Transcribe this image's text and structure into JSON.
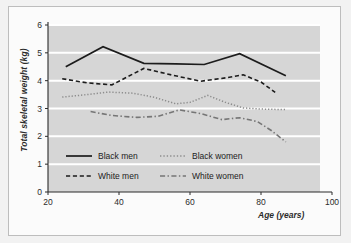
{
  "figure": {
    "background_color": "#f2f2f2",
    "panel_color": "#fbfbfb",
    "plot_band_color": "#d6d6d6",
    "gridline_color": "#ffffff",
    "axis_color": "#2b2b2b"
  },
  "chart_data": {
    "type": "line",
    "title": "",
    "xlabel": "Age (years)",
    "ylabel": "Total skeletal weight (kg)",
    "xlim": [
      20,
      100
    ],
    "ylim": [
      0,
      6
    ],
    "xticks": [
      20,
      40,
      60,
      80,
      100
    ],
    "yticks": [
      0,
      1,
      2,
      3,
      4,
      5,
      6
    ],
    "grid": "horizontal",
    "legend_position": "inside-lower-left",
    "series": [
      {
        "name": "Black men",
        "style": "solid",
        "color": "#1c1c1c",
        "x": [
          25,
          35.5,
          47,
          56,
          64,
          74,
          87
        ],
        "y": [
          4.5,
          5.22,
          4.62,
          4.6,
          4.58,
          4.97,
          4.18
        ]
      },
      {
        "name": "Black women",
        "style": "dotted",
        "color": "#8d8d8d",
        "x": [
          24,
          31,
          37,
          44,
          50,
          56,
          60,
          65,
          70,
          75,
          80,
          87
        ],
        "y": [
          3.41,
          3.5,
          3.59,
          3.55,
          3.4,
          3.17,
          3.22,
          3.47,
          3.22,
          3.02,
          2.98,
          2.96
        ]
      },
      {
        "name": "White men",
        "style": "dashed",
        "color": "#1c1c1c",
        "x": [
          24,
          31,
          38,
          47,
          55,
          63,
          70,
          75,
          80,
          84
        ],
        "y": [
          4.07,
          3.92,
          3.85,
          4.44,
          4.2,
          3.98,
          4.1,
          4.21,
          3.95,
          3.58
        ]
      },
      {
        "name": "White women",
        "style": "dashdot",
        "color": "#767676",
        "x": [
          32,
          38,
          45,
          51,
          57,
          63,
          69,
          74,
          79,
          83,
          87
        ],
        "y": [
          2.89,
          2.75,
          2.68,
          2.72,
          2.95,
          2.82,
          2.6,
          2.67,
          2.53,
          2.2,
          1.8
        ]
      }
    ]
  },
  "legend": {
    "entries": [
      {
        "label": "Black men",
        "style": "solid"
      },
      {
        "label": "Black women",
        "style": "dotted"
      },
      {
        "label": "White men",
        "style": "dashed"
      },
      {
        "label": "White women",
        "style": "dashdot"
      }
    ]
  }
}
